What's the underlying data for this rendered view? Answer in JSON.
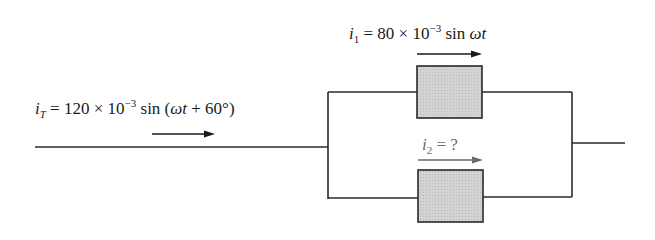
{
  "circuit": {
    "total_current": {
      "symbol": "i",
      "subscript": "T",
      "equals": "=",
      "coef": "120",
      "times": "×",
      "base": "10",
      "exponent": "−3",
      "func": "sin",
      "arg_open": "(",
      "omega_t": "ωt",
      "plus": "+",
      "phase": "60°",
      "arg_close": ")"
    },
    "branch1_current": {
      "symbol": "i",
      "subscript": "1",
      "equals": "=",
      "coef": "80",
      "times": "×",
      "base": "10",
      "exponent": "−3",
      "func": "sin",
      "omega_t": "ωt"
    },
    "branch2_current": {
      "symbol": "i",
      "subscript": "2",
      "equals": "=",
      "value": "?"
    },
    "colors": {
      "wire": "#2a2a2a",
      "element_fill": "#d0d0d0",
      "unknown_label": "#6a6a6a"
    }
  }
}
